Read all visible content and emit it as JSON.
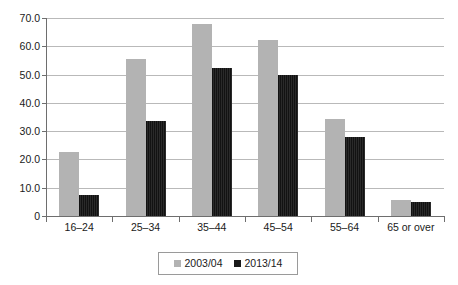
{
  "chart_data": {
    "type": "bar",
    "title": "",
    "subtitle": "",
    "xlabel": "",
    "ylabel": "",
    "categories": [
      "16–24",
      "25–34",
      "35–44",
      "45–54",
      "55–64",
      "65 or over"
    ],
    "series": [
      {
        "name": "2003/04",
        "color": "#b3b3b3",
        "values": [
          22.8,
          55.4,
          68.0,
          62.2,
          34.3,
          5.7
        ]
      },
      {
        "name": "2013/14",
        "color": "#1a1a1a",
        "values": [
          7.5,
          33.5,
          52.5,
          49.8,
          27.8,
          5.0
        ]
      }
    ],
    "ylim": [
      0,
      70
    ],
    "ytick_step": 10,
    "ytick_labels": [
      "70.0",
      "60.0",
      "50.0",
      "40.0",
      "30.0",
      "20.0",
      "10.0",
      "0"
    ],
    "ytick_values": [
      70,
      60,
      50,
      40,
      30,
      20,
      10,
      0
    ],
    "grid": true,
    "grid_axis": "y",
    "grid_color": "#b9b9b9",
    "axis_color": "#6e6e6e",
    "legend": {
      "position": "bottom",
      "bordered": true
    },
    "background": "#ffffff"
  }
}
